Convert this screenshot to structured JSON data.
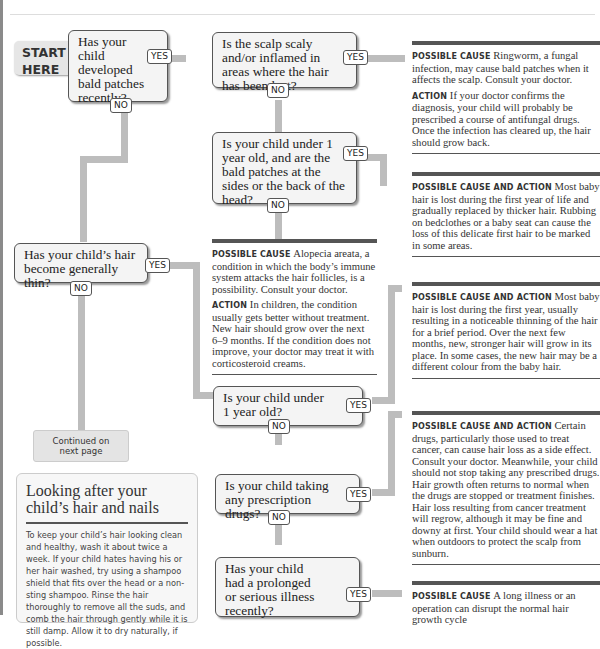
{
  "start_label": [
    "START",
    "HERE"
  ],
  "yes": "YES",
  "no": "NO",
  "questions": {
    "q1": "Has your child developed bald patches recently?",
    "q2": "Is the scalp scaly and/or inflamed in areas where the hair has been lost?",
    "q3": "Is your child under 1 year old, and are the bald patches at the sides or the back of the head?",
    "q4": "Has your child’s hair become generally thin?",
    "q5": "Is your child under 1 year old?",
    "q6": "Is your child taking any prescription drugs?",
    "q7": "Has your child had a prolonged or serious illness recently?"
  },
  "results": {
    "ringworm": {
      "cause_label": "Possible cause",
      "cause_text": "Ringworm, a fungal infection, may cause bald patches when it affects the scalp. Consult your doctor.",
      "action_label": "Action",
      "action_text": "If your doctor confirms the diagnosis, your child will probably be prescribed a course of antifungal drugs. Once the infection has cleared up, the hair should grow back."
    },
    "baby_rubbing": {
      "label": "Possible cause and action",
      "text": "Most baby hair is lost during the first year of life and gradually replaced by thicker hair. Rubbing on bedclothes or a baby seat can cause the loss of this delicate first hair to be marked in some areas."
    },
    "alopecia": {
      "cause_label": "Possible cause",
      "cause_text": "Alopecia areata, a condition in which the body’s immune system attacks the hair follicles, is a possibility. Consult your doctor.",
      "action_label": "Action",
      "action_text": "In children, the condition usually gets better without treatment. New hair should grow over the next 6–9 months. If the condition does not improve, your doctor may treat it with corticosteroid creams."
    },
    "baby_thinning": {
      "label": "Possible cause and action",
      "text": "Most baby hair is lost during the first year, usually resulting in a noticeable thinning of the hair for a brief period. Over the next few months, new, stronger hair will grow in its place. In some cases, the new hair may be a different colour from the baby hair."
    },
    "drugs": {
      "label": "Possible cause and action",
      "text": "Certain drugs, particularly those used to treat cancer, can cause hair loss as a side effect. Consult your doctor. Meanwhile, your child should not stop taking any prescribed drugs. Hair growth often returns to normal when the drugs are stopped or treatment finishes. Hair loss resulting from cancer treatment will regrow, although it may be fine and downy at first. Your child should wear a hat when outdoors to protect the scalp from sunburn."
    },
    "illness": {
      "label": "Possible cause",
      "text": "A long illness or an operation can disrupt the normal hair growth cycle"
    }
  },
  "continued": [
    "Continued on",
    "next page"
  ],
  "tip": {
    "title": "Looking after your child’s hair and nails",
    "body": "To keep your child’s hair looking clean and healthy, wash it about twice a week. If your child hates having his or her hair washed, try using a shampoo shield that fits over the head or a non-sting shampoo. Rinse the hair thoroughly to remove all the suds, and comb the hair through gently while it is still damp. Allow it to dry naturally, if possible."
  }
}
